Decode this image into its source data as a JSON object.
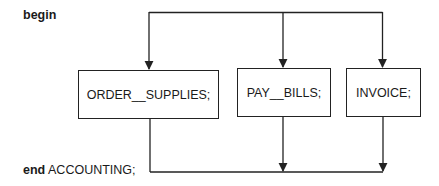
{
  "diagram": {
    "begin_keyword": "begin",
    "end_keyword": "end",
    "end_label": " ACCOUNTING;",
    "tasks": [
      {
        "label": "ORDER__SUPPLIES;"
      },
      {
        "label": "PAY__BILLS;"
      },
      {
        "label": "INVOICE;"
      }
    ],
    "structure": {
      "type": "concurrent-fork-join",
      "fork": "begin",
      "join": "end ACCOUNTING;",
      "parallel_branches": [
        "ORDER__SUPPLIES;",
        "PAY__BILLS;",
        "INVOICE;"
      ]
    },
    "colors": {
      "line": "#222222",
      "background": "#ffffff",
      "text": "#1a1a1a"
    }
  }
}
